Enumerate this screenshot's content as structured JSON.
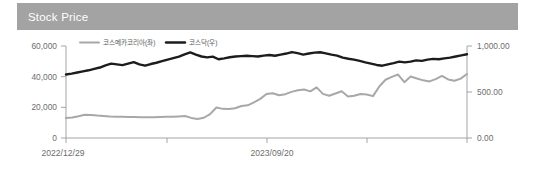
{
  "header": {
    "title": "Stock Price",
    "bar_color": "#a3a3a3",
    "title_color": "#ffffff"
  },
  "chart_data": {
    "type": "line",
    "title": "Stock Price",
    "xlabel": "",
    "ylabel": "",
    "grid": false,
    "legend_position": "top-left-inside",
    "x_tick_labels": [
      "2022/12/29",
      "2023/09/20"
    ],
    "left_axis": {
      "name": "코스메카코리아(좌)",
      "tick_labels": [
        "0",
        "20,000",
        "40,000",
        "60,000"
      ],
      "ticks": [
        0,
        20000,
        40000,
        60000
      ],
      "ylim": [
        0,
        60000
      ]
    },
    "right_axis": {
      "name": "코스닥(우)",
      "tick_labels": [
        "0.00",
        "500.00",
        "1,000.00"
      ],
      "ticks": [
        0,
        500,
        1000
      ],
      "ylim": [
        0,
        1000
      ]
    },
    "series": [
      {
        "name": "코스메카코리아(좌)",
        "axis": "left",
        "color": "#a8a8a8",
        "stroke_width": 2.0,
        "values": [
          13000,
          13400,
          14200,
          15200,
          15000,
          14600,
          14300,
          14000,
          13900,
          13800,
          13700,
          13700,
          13600,
          13500,
          13600,
          13700,
          13800,
          13900,
          14100,
          14300,
          13100,
          12400,
          13200,
          15600,
          19900,
          19000,
          18900,
          19400,
          20900,
          21300,
          23200,
          25500,
          28700,
          29200,
          27900,
          28600,
          30100,
          31100,
          31600,
          30400,
          33000,
          28800,
          27600,
          29000,
          30500,
          27100,
          27600,
          28700,
          28400,
          27300,
          33600,
          38000,
          39900,
          41400,
          36400,
          40100,
          38800,
          37600,
          36900,
          38400,
          40500,
          38200,
          37300,
          38700,
          41700
        ]
      },
      {
        "name": "코스닥(우)",
        "axis": "right",
        "color": "#1c1c1c",
        "stroke_width": 2.4,
        "values": [
          690,
          700,
          712,
          724,
          736,
          752,
          766,
          790,
          808,
          800,
          792,
          808,
          824,
          800,
          786,
          804,
          818,
          836,
          852,
          868,
          884,
          908,
          930,
          906,
          886,
          876,
          884,
          856,
          866,
          878,
          886,
          890,
          894,
          890,
          886,
          896,
          902,
          894,
          906,
          918,
          934,
          922,
          906,
          918,
          928,
          932,
          920,
          906,
          896,
          874,
          862,
          852,
          838,
          822,
          808,
          794,
          786,
          800,
          814,
          830,
          822,
          830,
          844,
          838,
          852,
          860,
          856,
          866,
          874,
          886,
          898,
          910
        ]
      }
    ]
  },
  "legend": [
    {
      "label": "코스메카코리아(좌)",
      "color": "#a8a8a8"
    },
    {
      "label": "코스닥(우)",
      "color": "#1c1c1c"
    }
  ],
  "axis_label_color": "#6d6d6d",
  "axis_line_color": "#9b9b9b"
}
